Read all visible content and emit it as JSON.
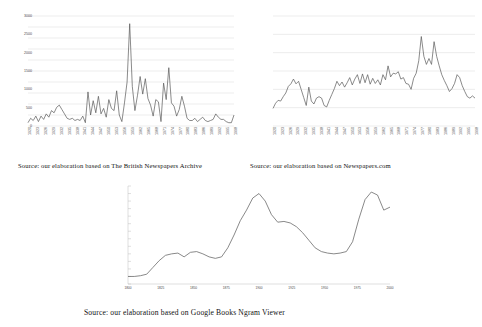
{
  "figure": {
    "panels": [
      {
        "id": "british-newspapers-archive",
        "caption": "Source: our elaboration  based on The British  Newspapers Archive"
      },
      {
        "id": "newspapers-com",
        "caption": "Source: our elaboration  based on Newspapers.com"
      },
      {
        "id": "google-books-ngram",
        "caption": "Source: our elaboration  based on Google  Books  Ngram  Viewer"
      }
    ]
  },
  "chart_data": [
    {
      "type": "line",
      "id": "british-newspapers-archive",
      "title": "",
      "xlabel": "",
      "ylabel": "",
      "ylim": [
        0,
        50
      ],
      "yticks": [
        0,
        5,
        10,
        15,
        20,
        25,
        30,
        35,
        40,
        45,
        50
      ],
      "ytick_labels": [
        "0",
        "5",
        "10",
        "15",
        "20",
        "25",
        "30",
        "35",
        "40",
        "45",
        "50"
      ],
      "grid": true,
      "legend": "none",
      "xtick_rotation": -90,
      "xtick_every": 3,
      "x": [
        1920,
        1921,
        1922,
        1923,
        1924,
        1925,
        1926,
        1927,
        1928,
        1929,
        1930,
        1931,
        1932,
        1933,
        1934,
        1935,
        1936,
        1937,
        1938,
        1939,
        1940,
        1941,
        1942,
        1943,
        1944,
        1945,
        1946,
        1947,
        1948,
        1949,
        1950,
        1951,
        1952,
        1953,
        1954,
        1955,
        1956,
        1957,
        1958,
        1959,
        1960,
        1961,
        1962,
        1963,
        1964,
        1965,
        1966,
        1967,
        1968,
        1969,
        1970,
        1971,
        1972,
        1973,
        1974,
        1975,
        1976,
        1977,
        1978,
        1979,
        1980,
        1981,
        1982,
        1983,
        1984,
        1985,
        1986,
        1987,
        1988,
        1989,
        1990,
        1991,
        1992,
        1993,
        1994,
        1995,
        1996,
        1997,
        1998,
        1999
      ],
      "xtick_labels": [
        "1920",
        "1923",
        "1926",
        "1929",
        "1932",
        "1935",
        "1938",
        "1941",
        "1944",
        "1947",
        "1950",
        "1953",
        "1956",
        "1959",
        "1962",
        "1965",
        "1968",
        "1971",
        "1974",
        "1977",
        "1980",
        "1983",
        "1986",
        "1989",
        "1992",
        "1995",
        "1998"
      ],
      "values": [
        1.5,
        3.5,
        2.5,
        4.5,
        2.0,
        4.5,
        3.0,
        5.5,
        4.0,
        7.0,
        6.0,
        8.5,
        9.5,
        7.5,
        5.5,
        3.5,
        3.0,
        3.5,
        2.5,
        3.0,
        2.5,
        4.5,
        1.5,
        15.5,
        5.0,
        11.5,
        6.0,
        13.5,
        5.5,
        8.0,
        4.0,
        12.0,
        8.0,
        7.0,
        16.0,
        5.0,
        2.0,
        10.5,
        20.0,
        46.5,
        18.0,
        7.0,
        14.0,
        22.5,
        14.5,
        21.5,
        12.5,
        9.5,
        4.5,
        12.0,
        11.0,
        2.0,
        19.5,
        12.0,
        26.5,
        10.5,
        9.0,
        4.5,
        7.5,
        13.5,
        9.0,
        3.5,
        2.5,
        2.5,
        3.5,
        2.0,
        3.0,
        4.0,
        2.5,
        2.0,
        2.5,
        3.0,
        5.5,
        4.0,
        3.0,
        3.0,
        2.0,
        1.5,
        1.5,
        5.0
      ]
    },
    {
      "type": "line",
      "id": "newspapers-com",
      "title": "",
      "xlabel": "",
      "ylabel": "",
      "ylim": [
        0,
        3000
      ],
      "yticks": [
        0,
        500,
        1000,
        1500,
        2000,
        2500,
        3000
      ],
      "ytick_labels": [
        "0",
        "500",
        "1000",
        "1500",
        "2000",
        "2500",
        "3000"
      ],
      "grid": true,
      "legend": "none",
      "xtick_rotation": -90,
      "xtick_every": 3,
      "x": [
        1920,
        1921,
        1922,
        1923,
        1924,
        1925,
        1926,
        1927,
        1928,
        1929,
        1930,
        1931,
        1932,
        1933,
        1934,
        1935,
        1936,
        1937,
        1938,
        1939,
        1940,
        1941,
        1942,
        1943,
        1944,
        1945,
        1946,
        1947,
        1948,
        1949,
        1950,
        1951,
        1952,
        1953,
        1954,
        1955,
        1956,
        1957,
        1958,
        1959,
        1960,
        1961,
        1962,
        1963,
        1964,
        1965,
        1966,
        1967,
        1968,
        1969,
        1970,
        1971,
        1972,
        1973,
        1974,
        1975,
        1976,
        1977,
        1978,
        1979,
        1980,
        1981,
        1982,
        1983,
        1984,
        1985,
        1986,
        1987,
        1988,
        1989,
        1990,
        1991,
        1992,
        1993,
        1994,
        1995,
        1996,
        1997,
        1998,
        1999
      ],
      "xtick_labels": [
        "1920",
        "1923",
        "1926",
        "1929",
        "1932",
        "1935",
        "1938",
        "1941",
        "1944",
        "1947",
        "1950",
        "1953",
        "1956",
        "1959",
        "1962",
        "1965",
        "1968",
        "1971",
        "1974",
        "1977",
        "1980",
        "1983",
        "1986",
        "1989",
        "1992",
        "1995",
        "1998"
      ],
      "values": [
        480,
        620,
        700,
        680,
        800,
        900,
        1080,
        1150,
        1280,
        1150,
        1220,
        1000,
        780,
        560,
        1060,
        680,
        600,
        760,
        800,
        760,
        560,
        520,
        700,
        860,
        1020,
        1220,
        1100,
        1200,
        1060,
        1180,
        1320,
        1120,
        1280,
        1400,
        1160,
        1420,
        1180,
        1400,
        1140,
        1300,
        1160,
        1260,
        1120,
        1400,
        1260,
        1640,
        1340,
        1440,
        1420,
        1480,
        1280,
        1320,
        1160,
        1140,
        1000,
        1300,
        1440,
        1780,
        2440,
        1900,
        1680,
        1840,
        1680,
        2300,
        1900,
        1640,
        1400,
        1240,
        1100,
        940,
        1020,
        1160,
        1400,
        1320,
        1100,
        940,
        800,
        760,
        820,
        760
      ]
    },
    {
      "type": "line",
      "id": "google-books-ngram",
      "title": "",
      "xlabel": "",
      "ylabel": "",
      "ylim": [
        0,
        1.3e-05
      ],
      "yticks": [
        0,
        1e-06,
        2e-06,
        3e-06,
        4e-06,
        5e-06,
        6e-06,
        7e-06,
        8e-06,
        9e-06,
        1e-05,
        1.1e-05,
        1.2e-05,
        1.3e-05
      ],
      "ytick_labels": [
        "0.0000000%",
        "0.0000010%",
        "0.0000020%",
        "0.0000030%",
        "0.0000040%",
        "0.0000050%",
        "0.0000060%",
        "0.0000070%",
        "0.0000080%",
        "0.0000090%",
        "0.0000100%",
        "0.0000110%",
        "0.0000120%",
        "0.0000130%"
      ],
      "grid": false,
      "legend": "none",
      "xtick_rotation": 0,
      "xtick_labels": [
        "1800",
        "1825",
        "1850",
        "1875",
        "1900",
        "1925",
        "1950",
        "1975",
        "2000"
      ],
      "x": [
        1800,
        1805,
        1810,
        1815,
        1820,
        1825,
        1830,
        1835,
        1840,
        1845,
        1850,
        1855,
        1860,
        1865,
        1870,
        1875,
        1880,
        1885,
        1890,
        1895,
        1900,
        1905,
        1910,
        1915,
        1920,
        1925,
        1930,
        1935,
        1940,
        1945,
        1950,
        1955,
        1960,
        1965,
        1970,
        1975,
        1980,
        1985,
        1990,
        1995,
        2000,
        2005,
        2008
      ],
      "values": [
        1e-06,
        1e-06,
        1.1e-06,
        1.3e-06,
        2.2e-06,
        3.1e-06,
        3.8e-06,
        4e-06,
        4.1e-06,
        3.6e-06,
        4.2e-06,
        4.3e-06,
        4e-06,
        3.6e-06,
        3.4e-06,
        3.6e-06,
        4.8e-06,
        6.5e-06,
        8.4e-06,
        9.8e-06,
        1.14e-05,
        1.2e-05,
        1.1e-05,
        9.2e-06,
        8.2e-06,
        8.3e-06,
        8.1e-06,
        7.6e-06,
        6.8e-06,
        5.8e-06,
        4.8e-06,
        4.3e-06,
        4.1e-06,
        4e-06,
        4.1e-06,
        4.3e-06,
        5.6e-06,
        8.6e-06,
        1.12e-05,
        1.22e-05,
        1.18e-05,
        9.8e-06,
        1.02e-05
      ]
    }
  ]
}
